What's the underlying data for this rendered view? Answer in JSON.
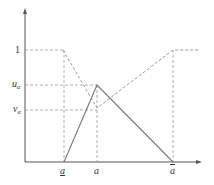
{
  "diagram": {
    "type": "fuzzy-number-membership",
    "axes": {
      "y_tick_labels": {
        "one": "1",
        "u": "u",
        "u_sub": "α",
        "v": "v",
        "v_sub": "α"
      },
      "x_tick_labels": {
        "a_lower": "a",
        "a_mid": "a",
        "a_upper": "a"
      }
    },
    "colors": {
      "axis": "#555555",
      "solid": "#777777",
      "dashed": "#999999",
      "text": "#333333"
    },
    "shapes": {
      "solid_triangle": [
        [
          64,
          162
        ],
        [
          97,
          85
        ],
        [
          173,
          162
        ]
      ],
      "dashed_nonmembership": [
        [
          25,
          50
        ],
        [
          63,
          50
        ],
        [
          97,
          108
        ],
        [
          173,
          50
        ],
        [
          200,
          50
        ]
      ],
      "vertical_guides_x": [
        64,
        97,
        173
      ]
    }
  }
}
